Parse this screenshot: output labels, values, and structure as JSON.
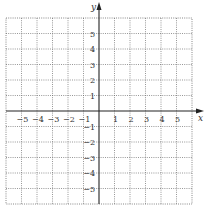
{
  "chart_data": {
    "type": "scatter",
    "title": "",
    "xlabel": "x",
    "ylabel": "y",
    "xlim": [
      -6,
      6
    ],
    "ylim": [
      -6,
      6
    ],
    "grid": true,
    "grid_style": "dotted",
    "x_ticks": [
      -5,
      -4,
      -3,
      -2,
      -1,
      1,
      2,
      3,
      4,
      5
    ],
    "y_ticks": [
      5,
      4,
      3,
      2,
      1,
      -1,
      -2,
      -3,
      -4,
      -5
    ],
    "x_tick_labels": [
      "−5",
      "−4",
      "−3",
      "−2",
      "−1",
      "1",
      "2",
      "3",
      "4",
      "5"
    ],
    "y_tick_labels": [
      "5",
      "4",
      "3",
      "2",
      "1",
      "−1",
      "−2",
      "−3",
      "−4",
      "−5"
    ],
    "series": [],
    "legend": null
  },
  "colors": {
    "axis": "#222222",
    "grid": "#6a6a6a",
    "text": "#333333",
    "background": "#ffffff"
  }
}
